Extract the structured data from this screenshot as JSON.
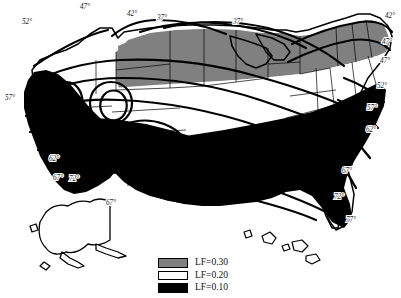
{
  "figure": {
    "kind": "thematic-map",
    "region": "United States",
    "includes_insets": [
      "Alaska",
      "Hawaii"
    ],
    "background_color": "#ffffff",
    "outline_color": "#000000"
  },
  "legend": {
    "position": "bottom-center",
    "items": [
      {
        "label": "LF=0.30",
        "value": 0.3,
        "swatch": "gray",
        "color": "#808080"
      },
      {
        "label": "LF=0.20",
        "value": 0.2,
        "swatch": "white",
        "color": "#ffffff"
      },
      {
        "label": "LF=0.10",
        "value": 0.1,
        "swatch": "black",
        "color": "#000000"
      }
    ]
  },
  "zones": [
    {
      "name": "northern-tier",
      "fill": "#808080",
      "legend_value": 0.3
    },
    {
      "name": "central-band",
      "fill": "#ffffff",
      "legend_value": 0.2
    },
    {
      "name": "southern-and-west-coast",
      "fill": "#000000",
      "legend_value": 0.1
    }
  ],
  "contour_labels": [
    {
      "id": "c-47-top",
      "text": "47°",
      "x": 80,
      "y": 9
    },
    {
      "id": "c-42-top",
      "text": "42°",
      "x": 127,
      "y": 16
    },
    {
      "id": "c-37-top-left",
      "text": "37°",
      "x": 157,
      "y": 20
    },
    {
      "id": "c-37-top-right",
      "text": "37°",
      "x": 233,
      "y": 24
    },
    {
      "id": "c-42-northeast",
      "text": "42°",
      "x": 385,
      "y": 18
    },
    {
      "id": "c-52-northwest",
      "text": "52°",
      "x": 22,
      "y": 24
    },
    {
      "id": "c-47-northeast",
      "text": "47°",
      "x": 382,
      "y": 44
    },
    {
      "id": "c-47-east",
      "text": "47°",
      "x": 380,
      "y": 63
    },
    {
      "id": "c-52-east",
      "text": "52°",
      "x": 377,
      "y": 88
    },
    {
      "id": "c-57-west",
      "text": "57°",
      "x": 5,
      "y": 100
    },
    {
      "id": "c-57-east",
      "text": "57°",
      "x": 367,
      "y": 110
    },
    {
      "id": "c-62-east",
      "text": "62°",
      "x": 366,
      "y": 132
    },
    {
      "id": "c-62-west",
      "text": "62°",
      "x": 49,
      "y": 161
    },
    {
      "id": "c-67-southwest",
      "text": "67°",
      "x": 53,
      "y": 180
    },
    {
      "id": "c-72-southwest",
      "text": "72°",
      "x": 69,
      "y": 181
    },
    {
      "id": "c-67-southcenter",
      "text": "67°",
      "x": 106,
      "y": 205
    },
    {
      "id": "c-67-southeast",
      "text": "67°",
      "x": 342,
      "y": 173
    },
    {
      "id": "c-72-southeast",
      "text": "72°",
      "x": 334,
      "y": 199
    },
    {
      "id": "c-77-florida",
      "text": "77°",
      "x": 346,
      "y": 222
    }
  ]
}
